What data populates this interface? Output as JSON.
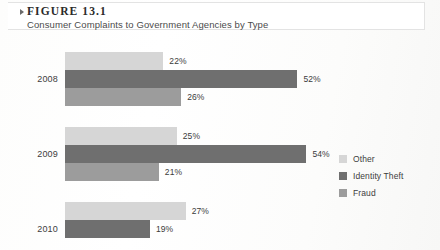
{
  "header": {
    "marker_icon": "triangle-collapse-icon",
    "figure_label": "FIGURE 13.1",
    "figure_title": "Consumer Complaints to Government Agencies by Type"
  },
  "legend": {
    "items": [
      {
        "label": "Other",
        "color": "#d6d6d6"
      },
      {
        "label": "Identity Theft",
        "color": "#6f6f6f"
      },
      {
        "label": "Fraud",
        "color": "#9c9c9c"
      }
    ]
  },
  "chart_data": {
    "type": "bar",
    "orientation": "horizontal",
    "title": "Consumer Complaints to Government Agencies by Type",
    "xlabel": "",
    "ylabel": "",
    "categories": [
      "2008",
      "2009",
      "2010"
    ],
    "series": [
      {
        "name": "Other",
        "color": "#d6d6d6",
        "values": [
          22,
          25,
          27
        ],
        "labels": [
          "22%",
          "25%",
          "27%"
        ]
      },
      {
        "name": "Identity Theft",
        "color": "#6f6f6f",
        "values": [
          52,
          54,
          19
        ],
        "labels": [
          "52%",
          "54%",
          "19%"
        ]
      },
      {
        "name": "Fraud",
        "color": "#9c9c9c",
        "values": [
          26,
          21,
          null
        ],
        "labels": [
          "26%",
          "21%",
          ""
        ]
      }
    ],
    "xlim": [
      0,
      60
    ],
    "grid": false,
    "legend_position": "right",
    "note": "2010 group is cropped at the bottom edge of the screenshot; its Fraud bar is not visible."
  }
}
